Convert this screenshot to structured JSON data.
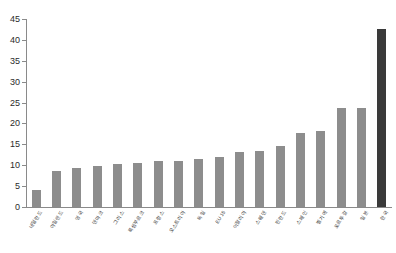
{
  "chart_data": {
    "type": "bar",
    "title": "",
    "xlabel": "",
    "ylabel": "",
    "ylim": [
      0,
      45
    ],
    "ytick_step": 5,
    "yticks": [
      "0",
      "5",
      "10",
      "15",
      "20",
      "25",
      "30",
      "35",
      "40",
      "45"
    ],
    "grid": false,
    "legend": "none",
    "bar_color": "#8d8d8d",
    "highlight_color": "#3a3a3a",
    "highlight_index": 17,
    "categories": [
      "네덜란드",
      "아일랜드",
      "영국",
      "덴마크",
      "그리스",
      "룩셈부르크",
      "프랑스",
      "오스트리아",
      "독일",
      "EU 15",
      "이탈리아",
      "스웨덴",
      "핀란드",
      "스페인",
      "벨기에",
      "포르투갈",
      "일본",
      "한국"
    ],
    "values": [
      4.0,
      8.7,
      9.3,
      9.8,
      10.2,
      10.6,
      11.0,
      11.1,
      11.5,
      11.9,
      13.2,
      13.3,
      14.6,
      17.8,
      18.3,
      23.8,
      23.8,
      42.6
    ]
  }
}
